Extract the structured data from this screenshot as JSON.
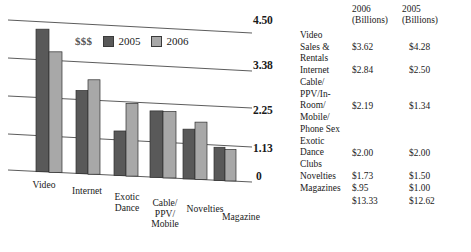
{
  "chart_data": {
    "type": "bar",
    "title": "",
    "xlabel": "",
    "ylabel": "$$$",
    "grid": true,
    "legend_position": "top-center",
    "ylim": [
      0,
      4.5
    ],
    "ytick_labels": [
      "4.50",
      "3.38",
      "2.25",
      "1.13",
      "0"
    ],
    "ytick_values": [
      4.5,
      3.38,
      2.25,
      1.13,
      0
    ],
    "categories": [
      "Video",
      "Internet",
      "Exotic\nDance",
      "Cable/\nPPV/\nMobile",
      "Novelties",
      "Magazine"
    ],
    "series": [
      {
        "name": "2005",
        "color": "#595959",
        "values": [
          4.28,
          2.5,
          1.34,
          2.0,
          1.5,
          1.0
        ]
      },
      {
        "name": "2006",
        "color": "#a8a8a8",
        "values": [
          3.62,
          2.84,
          2.19,
          2.0,
          1.73,
          0.95
        ]
      }
    ]
  },
  "legend": {
    "money_label": "$$$",
    "entries": [
      {
        "label": "2005",
        "color": "#595959"
      },
      {
        "label": "2006",
        "color": "#a8a8a8"
      }
    ]
  },
  "table": {
    "headers": {
      "category": "",
      "col_2006_line1": "2006",
      "col_2006_line2": "(Billions)",
      "col_2005_line1": "2005",
      "col_2005_line2": "(Billions)"
    },
    "rows": [
      {
        "category": "Video\nSales &\nRentals",
        "v2006": "$3.62",
        "v2005": "$4.28"
      },
      {
        "category": "Internet",
        "v2006": "$2.84",
        "v2005": "$2.50"
      },
      {
        "category": "Cable/\nPPV/In-\nRoom/\nMobile/\nPhone Sex",
        "v2006": "$2.19",
        "v2005": "$1.34"
      },
      {
        "category": "Exotic\nDance\nClubs",
        "v2006": "$2.00",
        "v2005": "$2.00"
      },
      {
        "category": "Novelties",
        "v2006": "$1.73",
        "v2005": "$1.50"
      },
      {
        "category": "Magazines",
        "v2006": "$.95",
        "v2005": "$1.00"
      }
    ],
    "totals": {
      "category": "",
      "v2006": "$13.33",
      "v2005": "$12.62"
    }
  }
}
